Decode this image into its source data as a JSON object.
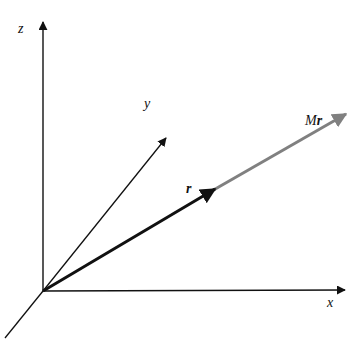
{
  "diagram": {
    "type": "3d-vector-diagram",
    "axes": {
      "x": {
        "label": "x"
      },
      "y": {
        "label": "y"
      },
      "z": {
        "label": "z"
      }
    },
    "vectors": [
      {
        "name": "r",
        "label": "r",
        "color": "#111111",
        "from": "origin"
      },
      {
        "name": "Mr",
        "label_prefix": "M",
        "label_vector": "r",
        "color": "#808080",
        "from": "tip-of-r"
      }
    ],
    "colors": {
      "axis": "#111111",
      "r": "#111111",
      "Mr": "#808080",
      "background": "#ffffff"
    }
  }
}
